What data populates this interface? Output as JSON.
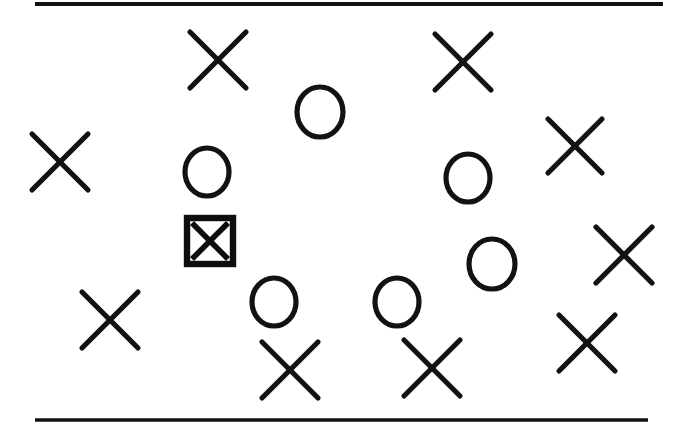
{
  "figure": {
    "background_color": "#ffffff",
    "ink_color": "#121212",
    "width": 680,
    "height": 427
  },
  "rules": [
    {
      "name": "top-rule",
      "x1": 35,
      "y1": 4,
      "x2": 663,
      "y2": 4,
      "thickness": 4
    },
    {
      "name": "bottom-rule",
      "x1": 35,
      "y1": 420,
      "x2": 648,
      "y2": 420,
      "thickness": 3.4
    }
  ],
  "chart_data": {
    "type": "scatter",
    "xlabel": "",
    "ylabel": "",
    "xlim": [
      0,
      680
    ],
    "ylim": [
      0,
      427
    ],
    "grid": false,
    "legend": "none",
    "counts": {
      "crosses": 10,
      "circles": 6,
      "targets": 1,
      "total_items": 17
    },
    "series": [
      {
        "name": "cross-distractor",
        "marker": "x",
        "color": "#121212",
        "points": [
          {
            "label": "cross-1",
            "x": 218,
            "y": 60,
            "size": 56
          },
          {
            "label": "cross-2",
            "x": 463,
            "y": 62,
            "size": 56
          },
          {
            "label": "cross-3",
            "x": 60,
            "y": 162,
            "size": 56
          },
          {
            "label": "cross-4",
            "x": 575,
            "y": 146,
            "size": 54
          },
          {
            "label": "cross-5",
            "x": 624,
            "y": 255,
            "size": 56
          },
          {
            "label": "cross-6",
            "x": 110,
            "y": 320,
            "size": 56
          },
          {
            "label": "cross-7",
            "x": 587,
            "y": 343,
            "size": 56
          },
          {
            "label": "cross-8",
            "x": 290,
            "y": 370,
            "size": 56
          },
          {
            "label": "cross-9",
            "x": 432,
            "y": 368,
            "size": 56
          },
          {
            "label": "cross-10",
            "x": 339,
            "y": 395,
            "size": 0
          }
        ]
      },
      {
        "name": "circle-distractor",
        "marker": "o",
        "color": "#121212",
        "points": [
          {
            "label": "circle-1",
            "x": 320,
            "y": 112,
            "radius": 23
          },
          {
            "label": "circle-2",
            "x": 207,
            "y": 172,
            "radius": 22
          },
          {
            "label": "circle-3",
            "x": 468,
            "y": 178,
            "radius": 22
          },
          {
            "label": "circle-4",
            "x": 492,
            "y": 264,
            "radius": 23
          },
          {
            "label": "circle-5",
            "x": 274,
            "y": 302,
            "radius": 22
          },
          {
            "label": "circle-6",
            "x": 397,
            "y": 302,
            "radius": 22
          }
        ]
      },
      {
        "name": "boxed-cross-target",
        "marker": "boxed-x",
        "color": "#0d0d0d",
        "points": [
          {
            "label": "target-1",
            "x": 210,
            "y": 241,
            "width": 46,
            "height": 46
          }
        ]
      }
    ]
  }
}
